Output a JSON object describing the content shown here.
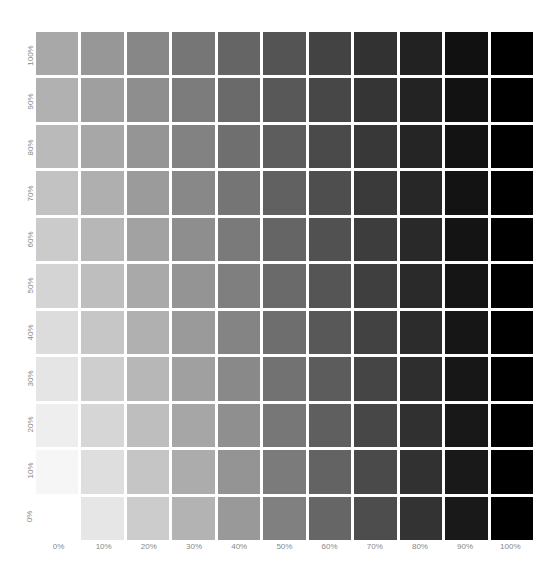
{
  "chart_data": {
    "type": "heatmap",
    "title": "",
    "xlabel": "",
    "ylabel": "",
    "x_ticks": [
      "0%",
      "10%",
      "20%",
      "30%",
      "40%",
      "50%",
      "60%",
      "70%",
      "80%",
      "90%",
      "100%"
    ],
    "y_ticks_top_to_bottom": [
      "100%",
      "90%",
      "80%",
      "70%",
      "60%",
      "50%",
      "40%",
      "30%",
      "20%",
      "10%",
      "0%"
    ],
    "grid_on": false,
    "legend": null
  },
  "colors": {
    "background": "#ffffff",
    "label": "#888888"
  }
}
